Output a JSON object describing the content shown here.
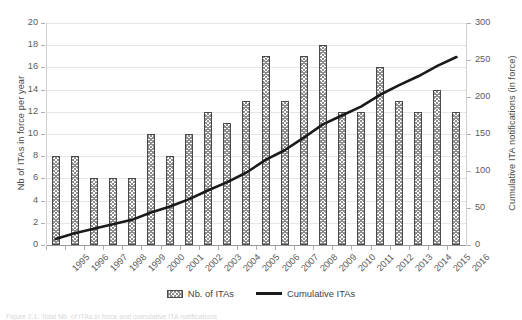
{
  "chart_data": {
    "type": "bar",
    "title": "",
    "xlabel": "",
    "categories": [
      "1995",
      "1996",
      "1997",
      "1998",
      "1999",
      "2000",
      "2001",
      "2002",
      "2003",
      "2004",
      "2005",
      "2006",
      "2007",
      "2008",
      "2009",
      "2010",
      "2011",
      "2012",
      "2013",
      "2014",
      "2015",
      "2016"
    ],
    "series": [
      {
        "name": "Nb. of ITAs",
        "type": "bar",
        "axis": "left",
        "values": [
          8,
          8,
          6,
          6,
          6,
          10,
          8,
          10,
          12,
          11,
          13,
          17,
          13,
          17,
          18,
          12,
          12,
          16,
          13,
          12,
          14,
          12
        ]
      },
      {
        "name": "Cumulative ITAs",
        "type": "line",
        "axis": "right",
        "values": [
          8,
          16,
          22,
          28,
          34,
          44,
          52,
          62,
          74,
          85,
          98,
          115,
          128,
          145,
          163,
          175,
          187,
          203,
          216,
          228,
          242,
          254
        ]
      }
    ],
    "left_axis": {
      "label": "Nb of ITAs in force per year",
      "ticks": [
        0,
        2,
        4,
        6,
        8,
        10,
        12,
        14,
        16,
        18,
        20
      ],
      "min": 0,
      "max": 20
    },
    "right_axis": {
      "label": "Cumulative ITA notifications (in force)",
      "ticks": [
        0,
        50,
        100,
        150,
        200,
        250,
        300
      ],
      "min": 0,
      "max": 300
    },
    "grid": true,
    "legend": {
      "position": "bottom",
      "entries": [
        "Nb. of ITAs",
        "Cumulative ITAs"
      ]
    },
    "colors": {
      "bar_outline": "#4a4a4a",
      "bar_hatch": "#8d8d8d",
      "line": "#1a1a1a",
      "gridline": "#e6e6e6",
      "axis": "#9a9a9a",
      "text": "#4a4a4a"
    }
  },
  "caption": {
    "text": "Figure 2.1. Total Nb. of ITAs in force and cumulative ITA notifications"
  }
}
